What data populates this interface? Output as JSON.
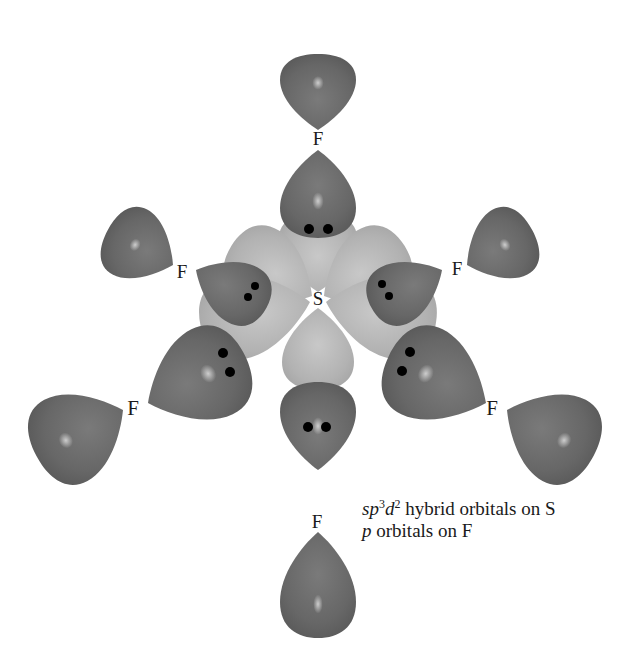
{
  "diagram": {
    "central_atom": {
      "label": "S"
    },
    "ligands": [
      {
        "position": "top",
        "label": "F"
      },
      {
        "position": "upper-left",
        "label": "F"
      },
      {
        "position": "upper-right",
        "label": "F"
      },
      {
        "position": "lower-left",
        "label": "F"
      },
      {
        "position": "lower-right",
        "label": "F"
      },
      {
        "position": "bottom",
        "label": "F"
      }
    ],
    "electron_pairs_per_bond": 2,
    "colors": {
      "p_orbital": "#6b6b6b",
      "hybrid_orbital": "#b4b4b4",
      "electron": "#000000",
      "background": "#ffffff"
    }
  },
  "legend": {
    "line1": {
      "italic_prefix": "sp",
      "sup1": "3",
      "italic_d": "d",
      "sup2": "2",
      "text": " hybrid orbitals on S"
    },
    "line2": {
      "italic_prefix": "p",
      "text": " orbitals on F"
    }
  }
}
